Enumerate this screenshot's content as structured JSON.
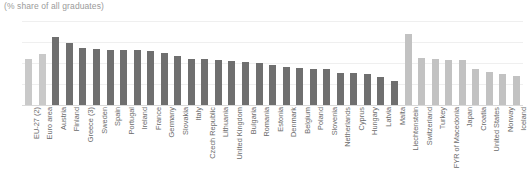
{
  "chart_data": {
    "type": "bar",
    "title": "(% share of all graduates)",
    "xlabel": "",
    "ylabel": "",
    "ylim": [
      0,
      40
    ],
    "yticks": [
      0,
      10,
      20,
      30,
      40
    ],
    "grid": true,
    "legend": "none",
    "colors": {
      "eu_aggregate": "#c9c9c9",
      "member_state": "#6f6f6f",
      "non_member": "#c2c2c2"
    },
    "categories": [
      "EU-27 (2)",
      "Euro area",
      "Austria",
      "Finland",
      "Greece (3)",
      "Sweden",
      "Spain",
      "Portugal",
      "Ireland",
      "France",
      "Germany",
      "Slovakia",
      "Italy",
      "Czech Republic",
      "Lithuania",
      "United Kingdom",
      "Bulgaria",
      "Romania",
      "Estonia",
      "Denmark",
      "Belgium",
      "Poland",
      "Slovenia",
      "Netherlands",
      "Cyprus",
      "Hungary",
      "Latvia",
      "Malta",
      "Liechtenstein",
      "Switzerland",
      "Turkey",
      "FYR of Macedonia",
      "Japan",
      "Croatia",
      "United States",
      "Norway",
      "Iceland"
    ],
    "values": [
      22.0,
      24.3,
      32.2,
      29.4,
      27.3,
      26.6,
      26.4,
      26.3,
      26.0,
      25.6,
      24.7,
      23.2,
      22.1,
      21.8,
      21.4,
      20.9,
      20.3,
      19.8,
      19.1,
      18.3,
      17.6,
      17.3,
      17.0,
      15.4,
      15.2,
      14.6,
      13.3,
      11.4,
      33.8,
      22.4,
      21.7,
      21.4,
      21.2,
      17.3,
      15.9,
      14.8,
      13.6
    ],
    "series_group": [
      "eu_aggregate",
      "eu_aggregate",
      "member_state",
      "member_state",
      "member_state",
      "member_state",
      "member_state",
      "member_state",
      "member_state",
      "member_state",
      "member_state",
      "member_state",
      "member_state",
      "member_state",
      "member_state",
      "member_state",
      "member_state",
      "member_state",
      "member_state",
      "member_state",
      "member_state",
      "member_state",
      "member_state",
      "member_state",
      "member_state",
      "member_state",
      "member_state",
      "member_state",
      "non_member",
      "non_member",
      "non_member",
      "non_member",
      "non_member",
      "non_member",
      "non_member",
      "non_member",
      "non_member"
    ]
  }
}
